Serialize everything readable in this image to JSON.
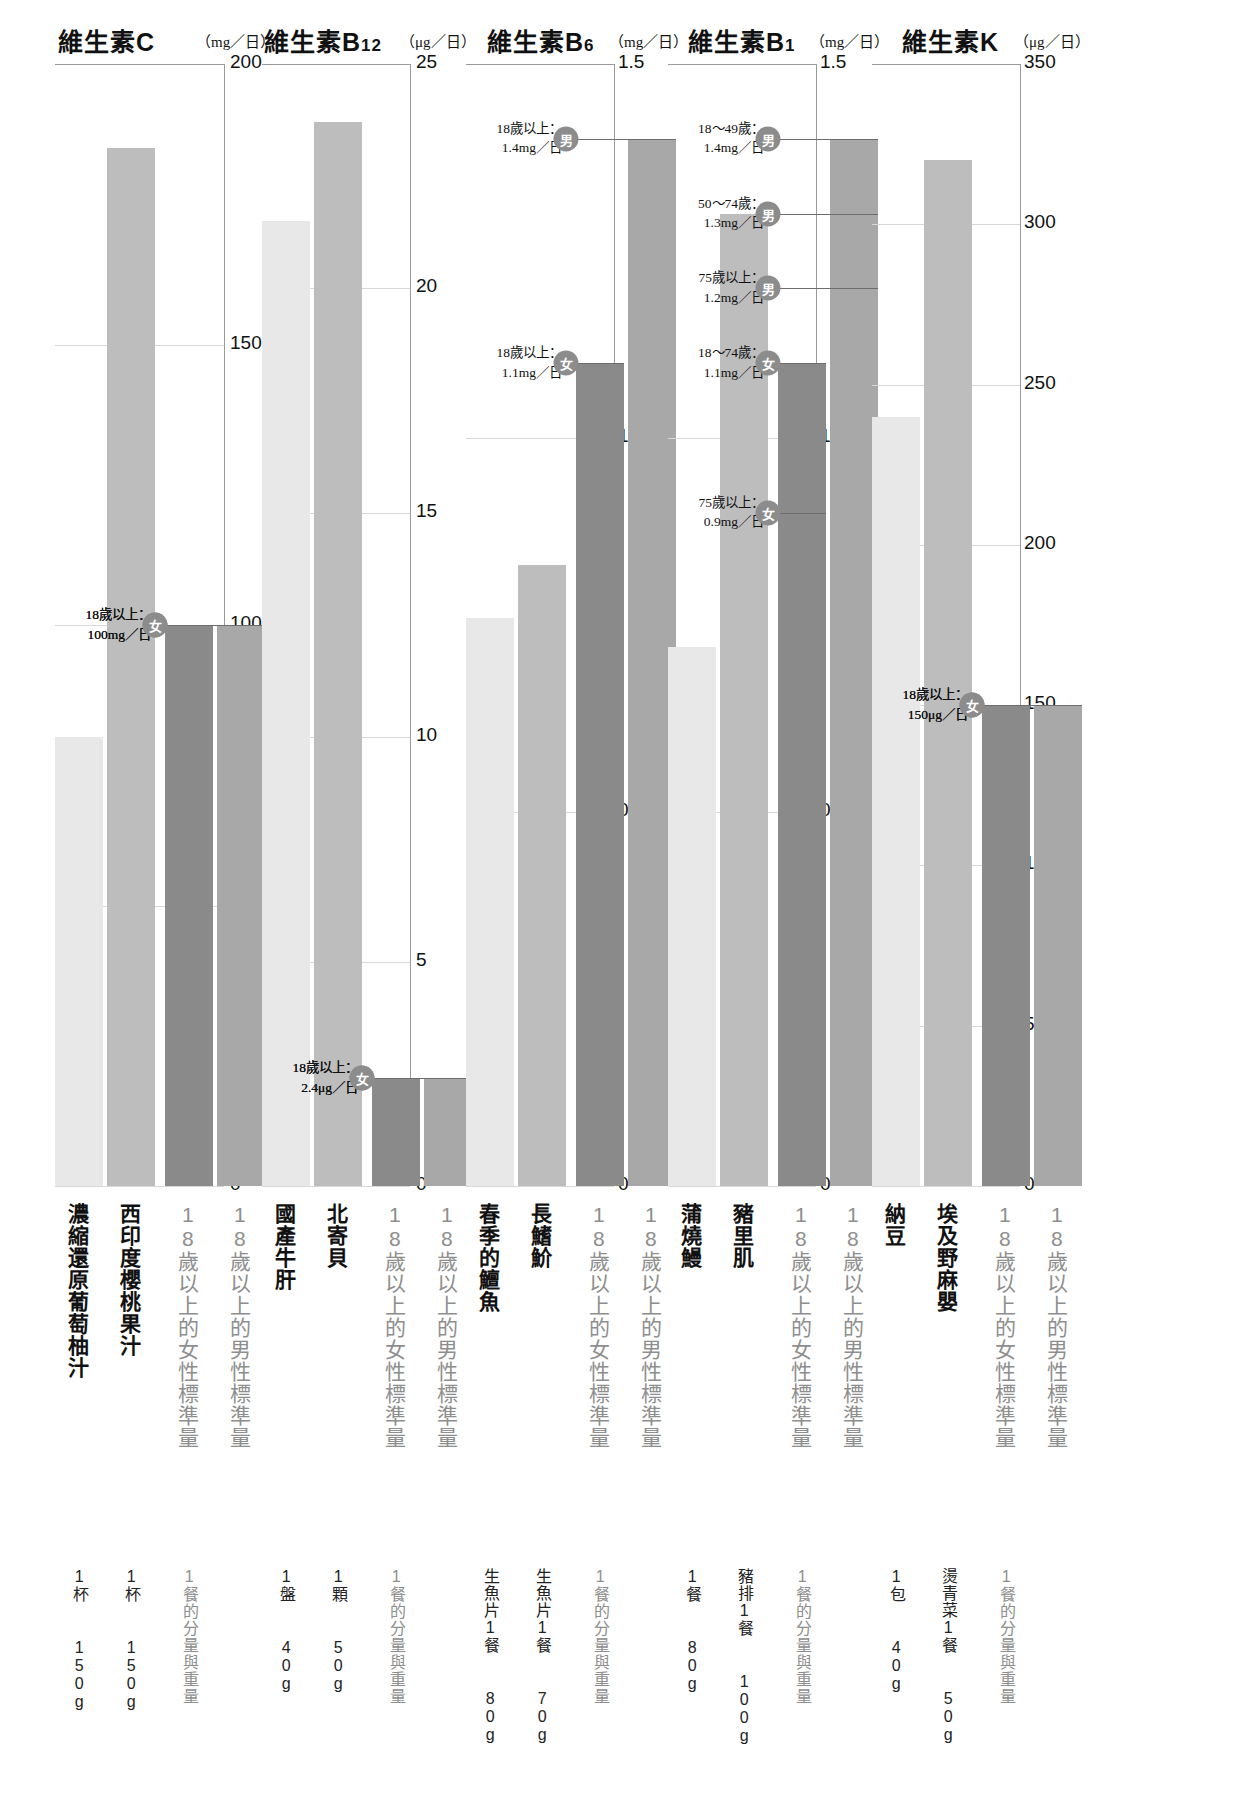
{
  "chart_data": {
    "type": "bar",
    "grid": true,
    "legend_position": "none",
    "panels": [
      {
        "id": "vitC",
        "title_main": "維生素C",
        "title_sub": "",
        "unit": "（mg／日）",
        "ylim": [
          0,
          200
        ],
        "yticks": [
          0,
          50,
          100,
          150,
          200
        ],
        "ylabel": "mg/日",
        "categories": [
          "濃縮還原葡萄柚汁",
          "西印度櫻桃果汁",
          "18歲以上的女性標準量",
          "18歲以上的男性標準量"
        ],
        "values": [
          80,
          185,
          100,
          100
        ],
        "kinds": [
          "food",
          "food",
          "std",
          "std"
        ],
        "qty": [
          "1杯\n150g",
          "1杯\n150g",
          "1餐的分量與重量",
          ""
        ],
        "annotations": [
          {
            "badge": "男",
            "line1": "18歲以上：",
            "line2": "100mg／日",
            "value": 100
          },
          {
            "badge": "女",
            "line1": "18歲以上：",
            "line2": "100mg／日",
            "value": 100
          }
        ]
      },
      {
        "id": "vitB12",
        "title_main": "維生素B",
        "title_sub": "12",
        "unit": "（μg／日）",
        "ylim": [
          0,
          25
        ],
        "yticks": [
          0,
          5,
          10,
          15,
          20,
          25
        ],
        "ylabel": "μg/日",
        "categories": [
          "國產牛肝",
          "北寄貝",
          "18歲以上的女性標準量",
          "18歲以上的男性標準量"
        ],
        "values": [
          21.5,
          23.7,
          2.4,
          2.4
        ],
        "kinds": [
          "food",
          "food",
          "std",
          "std"
        ],
        "qty": [
          "1盤\n40g",
          "1顆\n50g",
          "1餐的分量與重量",
          ""
        ],
        "annotations": [
          {
            "badge": "男",
            "line1": "18歲以上：",
            "line2": "2.4μg／日",
            "value": 2.4
          },
          {
            "badge": "女",
            "line1": "18歲以上：",
            "line2": "2.4μg／日",
            "value": 2.4
          }
        ]
      },
      {
        "id": "vitB6",
        "title_main": "維生素B",
        "title_sub": "6",
        "unit": "（mg／日）",
        "ylim": [
          0,
          1.5
        ],
        "yticks": [
          0,
          0.5,
          1.0,
          1.5
        ],
        "ylabel": "mg/日",
        "categories": [
          "春季的鱣魚",
          "長鰭魪",
          "18歲以上的女性標準量",
          "18歲以上的男性標準量"
        ],
        "values": [
          0.76,
          0.83,
          1.1,
          1.4
        ],
        "kinds": [
          "food",
          "food",
          "std",
          "std"
        ],
        "qty": [
          "生魚片1餐\n80g",
          "生魚片1餐\n70g",
          "1餐的分量與重量",
          ""
        ],
        "annotations": [
          {
            "badge": "男",
            "line1": "18歲以上：",
            "line2": "1.4mg／日",
            "value": 1.4
          },
          {
            "badge": "女",
            "line1": "18歲以上：",
            "line2": "1.1mg／日",
            "value": 1.1
          }
        ]
      },
      {
        "id": "vitB1",
        "title_main": "維生素B",
        "title_sub": "1",
        "unit": "（mg／日）",
        "ylim": [
          0,
          1.5
        ],
        "yticks": [
          0,
          0.5,
          1.0,
          1.5
        ],
        "ylabel": "mg/日",
        "categories": [
          "蒲燒鰻",
          "豬里肌",
          "18歲以上的女性標準量",
          "18歲以上的男性標準量"
        ],
        "values": [
          0.72,
          1.3,
          1.1,
          1.4
        ],
        "kinds": [
          "food",
          "food",
          "std",
          "std"
        ],
        "qty": [
          "1餐\n80g",
          "豬排1餐\n100g",
          "1餐的分量與重量",
          ""
        ],
        "annotations": [
          {
            "badge": "男",
            "line1": "18～49歲：",
            "line2": "1.4mg／日",
            "value": 1.4
          },
          {
            "badge": "男",
            "line1": "50～74歲：",
            "line2": "1.3mg／日",
            "value": 1.3
          },
          {
            "badge": "男",
            "line1": "75歲以上：",
            "line2": "1.2mg／日",
            "value": 1.2
          },
          {
            "badge": "女",
            "line1": "18～74歲：",
            "line2": "1.1mg／日",
            "value": 1.1
          },
          {
            "badge": "女",
            "line1": "75歲以上：",
            "line2": "0.9mg／日",
            "value": 0.9
          }
        ]
      },
      {
        "id": "vitK",
        "title_main": "維生素K",
        "title_sub": "",
        "unit": "（μg／日）",
        "ylim": [
          0,
          350
        ],
        "yticks": [
          0,
          50,
          100,
          150,
          200,
          250,
          300,
          350
        ],
        "ylabel": "μg/日",
        "categories": [
          "納豆",
          "埃及野麻嬰",
          "18歲以上的女性標準量",
          "18歲以上的男性標準量"
        ],
        "values": [
          240,
          320,
          150,
          150
        ],
        "kinds": [
          "food",
          "food",
          "std",
          "std"
        ],
        "qty": [
          "1包\n40g",
          "燙青菜1餐\n50g",
          "1餐的分量與重量",
          ""
        ],
        "annotations": [
          {
            "badge": "男",
            "line1": "18歲以上：",
            "line2": "150μg／日",
            "value": 150
          },
          {
            "badge": "女",
            "line1": "18歲以上：",
            "line2": "150μg／日",
            "value": 150
          }
        ]
      }
    ],
    "colors": {
      "bar_food_light": "#e8e8e8",
      "bar_food_mid": "#bdbdbd",
      "bar_std_female": "#8a8a8a",
      "bar_std_male": "#a8a8a8",
      "badge": "#8c8c8c",
      "grid": "#d8d8d8",
      "axis": "#9a9a9a"
    },
    "labels": {
      "std_female": "18歲以上的女性標準量",
      "std_male": "18歲以上的男性標準量",
      "portion_note": "1餐的分量與重量"
    }
  }
}
